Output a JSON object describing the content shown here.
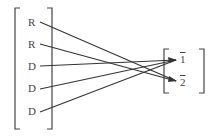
{
  "diagram": {
    "left_items": [
      {
        "label": "R",
        "x": 28,
        "y": 17
      },
      {
        "label": "R",
        "x": 28,
        "y": 39
      },
      {
        "label": "D",
        "x": 28,
        "y": 61
      },
      {
        "label": "D",
        "x": 28,
        "y": 83
      },
      {
        "label": "D",
        "x": 28,
        "y": 106
      }
    ],
    "right_items": [
      {
        "label": "1",
        "x": 180,
        "y": 54
      },
      {
        "label": "2",
        "x": 180,
        "y": 77
      }
    ],
    "connections": [
      {
        "from": 0,
        "to": 1
      },
      {
        "from": 1,
        "to": 1
      },
      {
        "from": 2,
        "to": 0
      },
      {
        "from": 3,
        "to": 0
      },
      {
        "from": 4,
        "to": 0
      }
    ],
    "line_color": "#333333"
  }
}
